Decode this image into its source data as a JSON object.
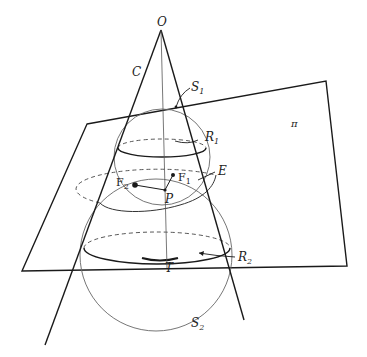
{
  "diagram": {
    "labels": {
      "apex": "O",
      "cone": "C",
      "sphere1": "S",
      "sphere1_sub": "1",
      "sphere2": "S",
      "sphere2_sub": "2",
      "circle1": "R",
      "circle1_sub": "1",
      "circle2": "R",
      "circle2_sub": "2",
      "plane": "π",
      "ellipse": "E",
      "focus1": "F",
      "focus1_sub": "1",
      "focus2": "F",
      "focus2_sub": "2",
      "point_p": "P",
      "point_t": "T"
    },
    "colors": {
      "line": "#1a1a1a",
      "thin_line": "#555555",
      "background": "#ffffff"
    }
  }
}
